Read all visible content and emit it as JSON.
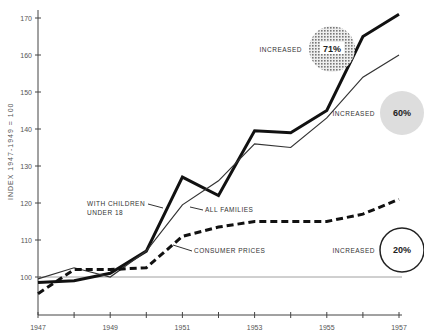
{
  "chart_data": {
    "type": "line",
    "title": "",
    "xlabel": "",
    "ylabel": "INDEX 1947-1949 = 100",
    "x": [
      1947,
      1948,
      1949,
      1950,
      1951,
      1952,
      1953,
      1954,
      1955,
      1956,
      1957
    ],
    "xticks": [
      "1947",
      "",
      "1949",
      "",
      "1951",
      "",
      "1953",
      "",
      "1955",
      "",
      "1957"
    ],
    "yticks": [
      100,
      110,
      120,
      130,
      140,
      150,
      160,
      170
    ],
    "xlim": [
      1947,
      1957
    ],
    "ylim": [
      90,
      172
    ],
    "baseline": 100,
    "series": [
      {
        "name": "WITH CHILDREN UNDER 18",
        "style": "thick",
        "values": [
          98.5,
          99,
          101,
          107,
          127,
          122,
          139.5,
          139,
          145,
          165,
          171
        ]
      },
      {
        "name": "ALL FAMILIES",
        "style": "thin",
        "values": [
          99.5,
          102.5,
          100,
          107,
          119.5,
          126,
          136,
          135,
          143,
          154,
          160
        ]
      },
      {
        "name": "CONSUMER PRICES",
        "style": "dashed",
        "values": [
          95.5,
          102,
          102,
          102.5,
          111,
          113.5,
          115,
          115,
          115,
          117,
          121
        ]
      }
    ],
    "annotations": [
      {
        "text": "WITH CHILDREN",
        "text2": "UNDER 18"
      },
      {
        "text": "ALL FAMILIES"
      },
      {
        "text": "CONSUMER PRICES"
      }
    ],
    "badges": [
      {
        "label": "INCREASED",
        "value": "71%",
        "style": "dotted"
      },
      {
        "label": "INCREASED",
        "value": "60%",
        "style": "gray"
      },
      {
        "label": "INCREASED",
        "value": "20%",
        "style": "outline"
      }
    ]
  }
}
